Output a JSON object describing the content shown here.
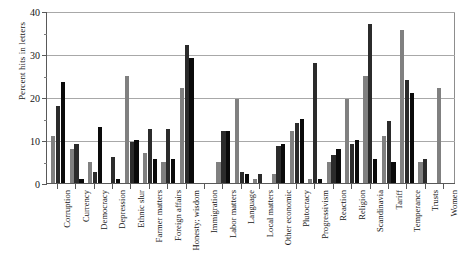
{
  "chart_data": {
    "type": "bar",
    "title": "",
    "xlabel": "",
    "ylabel": "Percent hits in letters",
    "ylim": [
      0,
      40
    ],
    "yticks": [
      0,
      10,
      20,
      30,
      40
    ],
    "ytick_labels": [
      "0",
      "10",
      "20",
      "30",
      "40"
    ],
    "grid": true,
    "legend": "none",
    "orientation": "vertical",
    "grouped": true,
    "bars_per_group": 3,
    "categories": [
      "Corruption",
      "Currency",
      "Democracy",
      "Depression",
      "Ethnic slur",
      "Farmer matters",
      "Foreign affairs",
      "Honesty; wisdom",
      "Immigration",
      "Labor matters",
      "Language",
      "Local matters",
      "Other economic",
      "Plutocracy",
      "Progressivism",
      "Reaction",
      "Religion",
      "Scandinavia",
      "Tariff",
      "Temperance",
      "Trusts",
      "Women"
    ],
    "series": [
      {
        "name": "Series 1",
        "color": "#808080",
        "values": [
          11,
          8,
          5,
          0,
          25,
          7,
          5,
          22,
          0,
          5,
          19.5,
          1,
          2,
          12,
          1,
          5,
          19.5,
          25,
          11,
          35.5,
          5,
          22
        ]
      },
      {
        "name": "Series 2",
        "color": "#2b2b2b",
        "values": [
          18,
          9,
          2.5,
          6,
          9.5,
          12.5,
          12.5,
          32,
          0,
          12,
          2.5,
          2,
          8.5,
          14,
          28,
          6.5,
          9,
          37,
          14.5,
          24,
          5.5,
          0
        ]
      },
      {
        "name": "Series 3",
        "color": "#0a0a0a",
        "values": [
          23.5,
          1,
          13,
          1,
          10,
          5.5,
          5.5,
          29,
          0,
          12,
          2,
          0,
          9,
          15,
          1,
          8,
          10,
          5.5,
          5,
          21,
          0,
          0
        ]
      }
    ]
  }
}
